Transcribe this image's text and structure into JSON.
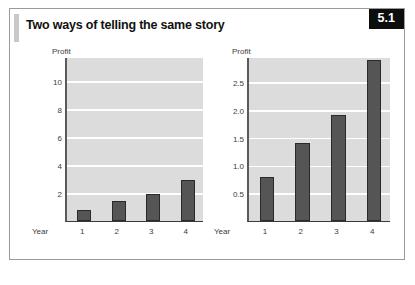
{
  "figure": {
    "title": "Two ways of telling the same story",
    "number": "5.1"
  },
  "colors": {
    "plot_background": "#dcdcdc",
    "gridline": "#ffffff",
    "bar_fill": "#555555",
    "bar_outline": "#2a2a2a",
    "badge_background": "#0d0d0d",
    "badge_text": "#ffffff",
    "frame_border": "#9a9a9a"
  },
  "chart_data": [
    {
      "type": "bar",
      "title": "",
      "panel": "left",
      "xlabel": "Year",
      "ylabel": "Profit",
      "categories": [
        "1",
        "2",
        "3",
        "4"
      ],
      "values": [
        0.8,
        1.4,
        1.9,
        2.9
      ],
      "yticks": [
        2,
        4,
        6,
        8,
        10
      ],
      "ytick_labels": [
        "2",
        "4",
        "6",
        "8",
        "10"
      ],
      "ylim": [
        0,
        11.7
      ],
      "grid": true,
      "legend": "none"
    },
    {
      "type": "bar",
      "title": "",
      "panel": "right",
      "xlabel": "Year",
      "ylabel": "Profit",
      "categories": [
        "1",
        "2",
        "3",
        "4"
      ],
      "values": [
        0.8,
        1.4,
        1.9,
        2.9
      ],
      "yticks": [
        0.5,
        1.0,
        1.5,
        2.0,
        2.5
      ],
      "ytick_labels": [
        "0.5",
        "1.0",
        "1.5",
        "2.0",
        "2.5"
      ],
      "ylim": [
        0,
        2.95
      ],
      "grid": true,
      "legend": "none"
    }
  ]
}
